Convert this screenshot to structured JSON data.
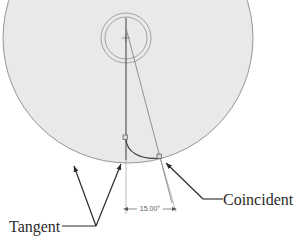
{
  "drawing": {
    "title": "CAD sketch relations illustration",
    "background_color": "#ffffff",
    "body_fill_color": "#e9e9e9",
    "outline_color": "#8a8a8a",
    "construction_color": "#6f6f6f",
    "annotation_color": "#2b2b2b",
    "dimension_color": "#5a5a5a"
  },
  "shapes": {
    "main_circle": {
      "name": "large-body-circle",
      "center_x": 128,
      "center_y": 38,
      "radius": 125
    },
    "outer_hub_circle": {
      "name": "hub-outer-circle",
      "center_x": 126,
      "center_y": 38,
      "radius": 25
    },
    "inner_hub_circle": {
      "name": "hub-inner-circle",
      "center_x": 126,
      "center_y": 38,
      "radius": 21
    },
    "center_point": {
      "x": 126,
      "y": 38
    },
    "vertical_centerline": {
      "x1": 126,
      "y1": 20,
      "x2": 126,
      "y2": 180
    },
    "angled_construction_line": {
      "x1": 126,
      "y1": 30,
      "x2": 170,
      "y2": 200,
      "angle_degrees": 15
    },
    "tangent_arc": {
      "start_x": 126,
      "start_y": 138,
      "end_x": 160,
      "end_y": 158
    }
  },
  "markers": {
    "tangent_marker_upper": {
      "x": 125,
      "y": 138
    },
    "tangent_marker_lower": {
      "x": 159,
      "y": 157
    },
    "coincident_marker": {
      "x": 159,
      "y": 157
    }
  },
  "dimension": {
    "name": "angular-dimension",
    "value_label": "15.00°",
    "left_extension": {
      "x1": 126,
      "y1": 160,
      "x2": 126,
      "y2": 212
    },
    "right_extension": {
      "x1": 160,
      "y1": 160,
      "x2": 175,
      "y2": 210
    },
    "arrow_line": {
      "x1": 126,
      "y1": 209,
      "x2": 172,
      "y2": 209
    },
    "text_x": 149,
    "text_y": 211
  },
  "annotations": [
    {
      "id": "tangent",
      "label": "Tangent",
      "text_x": 10,
      "text_y": 231,
      "leader_x1": 63,
      "leader_y1": 227,
      "leader_x2": 95,
      "leader_y2": 227,
      "arrows": [
        {
          "from_x": 95,
          "from_y": 227,
          "to_x": 72,
          "to_y": 163
        },
        {
          "from_x": 95,
          "from_y": 227,
          "to_x": 122,
          "to_y": 163
        }
      ]
    },
    {
      "id": "coincident",
      "label": "Coincident",
      "text_x": 224,
      "text_y": 205,
      "leader_x1": 222,
      "leader_y1": 200,
      "leader_x2": 204,
      "leader_y2": 200,
      "arrows": [
        {
          "from_x": 204,
          "from_y": 200,
          "to_x": 164,
          "to_y": 162
        }
      ]
    }
  ]
}
